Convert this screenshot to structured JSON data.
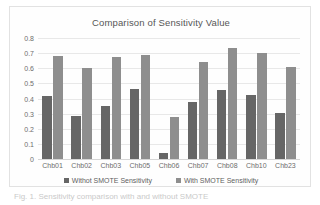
{
  "chart_data": {
    "type": "bar",
    "title": "Comparison of Sensitivity Value",
    "xlabel": "",
    "ylabel": "",
    "ylim": [
      0,
      0.8
    ],
    "yticks": [
      "0",
      "0.1",
      "0.2",
      "0.3",
      "0.4",
      "0.5",
      "0.6",
      "0.7",
      "0.8"
    ],
    "ytick_values": [
      0,
      0.1,
      0.2,
      0.3,
      0.4,
      0.5,
      0.6,
      0.7,
      0.8
    ],
    "grid": true,
    "legend_position": "bottom",
    "categories": [
      "Chb01",
      "Chb02",
      "Chb03",
      "Chb05",
      "Chb06",
      "Chb07",
      "Chb08",
      "Chb10",
      "Chb23"
    ],
    "series": [
      {
        "name": "Withot SMOTE Sensitivity",
        "color": "#666666",
        "values": [
          0.415,
          0.285,
          0.35,
          0.46,
          0.04,
          0.375,
          0.455,
          0.42,
          0.305
        ]
      },
      {
        "name": "With SMOTE Sensitivity",
        "color": "#8e8e8e",
        "values": [
          0.68,
          0.6,
          0.675,
          0.69,
          0.275,
          0.64,
          0.735,
          0.7,
          0.61
        ]
      }
    ]
  },
  "caption": {
    "text": "Fig. 1.  Sensitivity comparison with and without SMOTE"
  }
}
